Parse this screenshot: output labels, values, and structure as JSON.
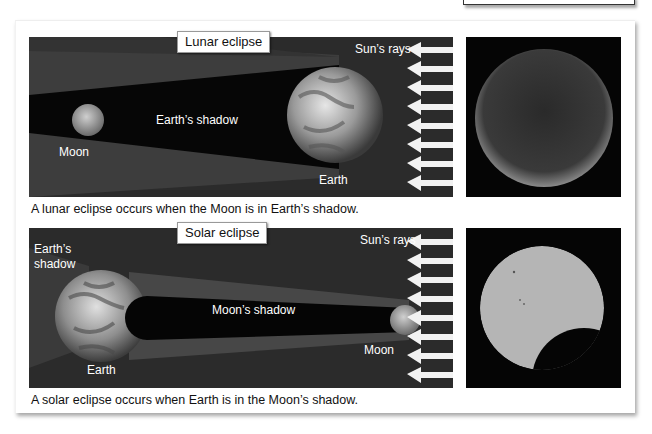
{
  "lunar": {
    "title": "Lunar eclipse",
    "labels": {
      "suns_rays": "Sun’s rays",
      "earths_shadow": "Earth’s shadow",
      "moon": "Moon",
      "earth": "Earth"
    },
    "caption": "A lunar eclipse occurs when the Moon is in Earth’s shadow.",
    "photo_icon": "eclipsed-moon-photo"
  },
  "solar": {
    "title": "Solar eclipse",
    "labels": {
      "suns_rays": "Sun’s rays",
      "earths_shadow": "Earth’s shadow",
      "moons_shadow": "Moon’s shadow",
      "moon": "Moon",
      "earth": "Earth"
    },
    "caption": "A solar eclipse occurs when Earth is in the Moon’s shadow.",
    "photo_icon": "partially-eclipsed-sun-photo"
  },
  "colors": {
    "space": "#2b2b2b",
    "umbra": "#050505",
    "penumbra": "#3f3f3f",
    "arrow": "#f2f2f2",
    "sun_disk": "#b9b9b9"
  },
  "rays_count": 8
}
